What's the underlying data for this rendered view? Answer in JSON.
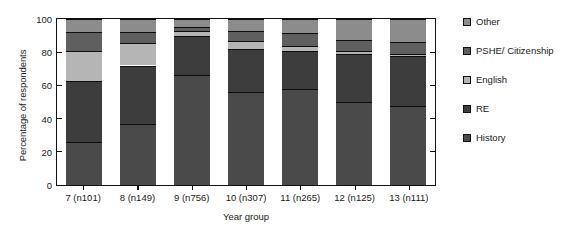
{
  "chart_data": {
    "type": "bar",
    "subtype": "stacked-bar-100",
    "title": "",
    "xlabel": "Year group",
    "ylabel": "Percentage of respondents",
    "categories": [
      "7 (n101)",
      "8 (n149)",
      "9 (n756)",
      "10 (n307)",
      "11 (n265)",
      "12 (n125)",
      "13 (n111)"
    ],
    "ylim": [
      0,
      100
    ],
    "yticks": [
      0,
      20,
      40,
      60,
      80,
      100
    ],
    "ytick_labels": [
      "0",
      "20",
      "40",
      "60",
      "80",
      "100"
    ],
    "grid": false,
    "legend_position": "right",
    "stack_order_bottom_to_top": [
      "History",
      "RE",
      "English",
      "PSHE/ Citizenship",
      "Other"
    ],
    "series": [
      {
        "name": "History",
        "color": "#4a4a4a",
        "values": [
          26.0,
          36.5,
          66.0,
          56.0,
          58.0,
          50.0,
          47.5
        ]
      },
      {
        "name": "RE",
        "color": "#3d3d3d",
        "values": [
          36.5,
          35.5,
          24.0,
          26.0,
          23.0,
          29.0,
          30.0
        ]
      },
      {
        "name": "English",
        "color": "#b5b5b5",
        "values": [
          18.0,
          13.5,
          2.5,
          5.0,
          3.0,
          2.0,
          1.5
        ]
      },
      {
        "name": "PSHE/ Citizenship",
        "color": "#5f5f5f",
        "values": [
          11.5,
          6.5,
          2.5,
          6.0,
          7.5,
          6.5,
          7.0
        ]
      },
      {
        "name": "Other",
        "color": "#8c8c8c",
        "values": [
          8.0,
          8.0,
          5.0,
          7.0,
          8.5,
          12.5,
          14.0
        ]
      }
    ]
  },
  "legend": {
    "items": [
      {
        "label": "Other",
        "color": "#8c8c8c"
      },
      {
        "label": "PSHE/ Citizenship",
        "color": "#5f5f5f"
      },
      {
        "label": "English",
        "color": "#b5b5b5"
      },
      {
        "label": "RE",
        "color": "#3d3d3d"
      },
      {
        "label": "History",
        "color": "#4a4a4a"
      }
    ]
  },
  "axes": {
    "y_title": "Percentage of respondents",
    "x_title": "Year group"
  }
}
